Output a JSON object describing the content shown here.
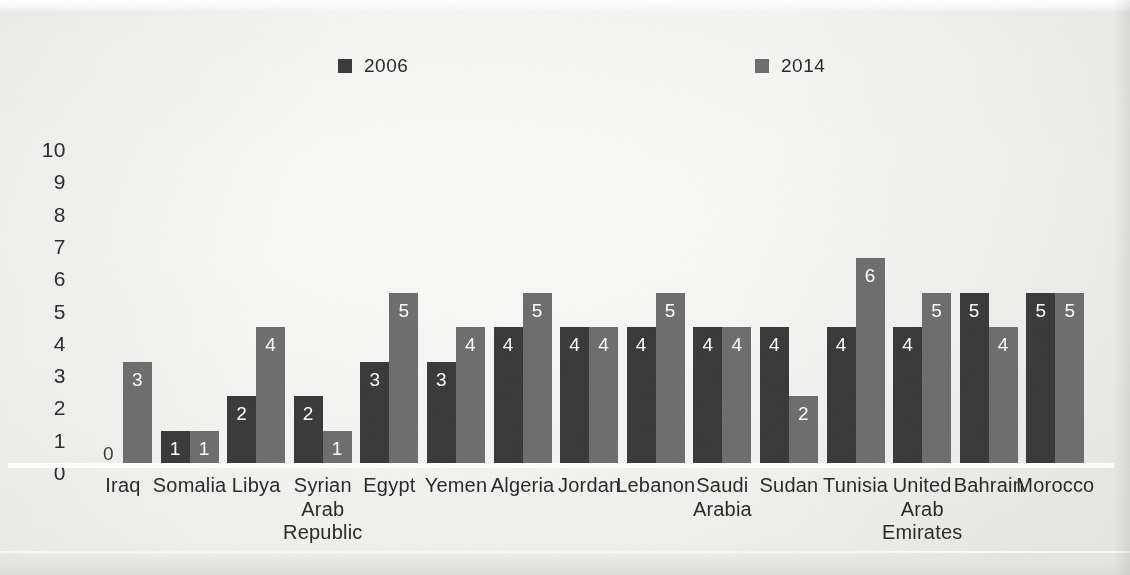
{
  "legend": {
    "entries": [
      {
        "label": "2006",
        "color": "#3b3b3b"
      },
      {
        "label": "2014",
        "color": "#6f6f6f"
      }
    ]
  },
  "y_axis": {
    "ticks": [
      "10",
      "9",
      "8",
      "7",
      "6",
      "5",
      "4",
      "3",
      "2",
      "1",
      "0"
    ]
  },
  "chart_data": {
    "type": "bar",
    "title": "",
    "subtitle": "",
    "xlabel": "",
    "ylabel": "",
    "ylim": [
      0,
      10
    ],
    "ytick_step": 1,
    "grid": false,
    "legend_position": "top",
    "orientation": "vertical",
    "grouping": "grouped",
    "bar_value_labels": true,
    "categories": [
      "Iraq",
      "Somalia",
      "Libya",
      "Syrian Arab Republic",
      "Egypt",
      "Yemen",
      "Algeria",
      "Jordan",
      "Lebanon",
      "Saudi Arabia",
      "Sudan",
      "Tunisia",
      "United Arab Emirates",
      "Bahrain",
      "Morocco"
    ],
    "category_label_lines": [
      [
        "Iraq"
      ],
      [
        "Somalia"
      ],
      [
        "Libya"
      ],
      [
        "Syrian",
        "Arab",
        "Republic"
      ],
      [
        "Egypt"
      ],
      [
        "Yemen"
      ],
      [
        "Algeria"
      ],
      [
        "Jordan"
      ],
      [
        "Lebanon"
      ],
      [
        "Saudi",
        "Arabia"
      ],
      [
        "Sudan"
      ],
      [
        "Tunisia"
      ],
      [
        "United",
        "Arab",
        "Emirates"
      ],
      [
        "Bahrain"
      ],
      [
        "Morocco"
      ]
    ],
    "series": [
      {
        "name": "2006",
        "color": "#3b3b3b",
        "values": [
          0,
          1,
          2,
          2,
          3,
          3,
          4,
          4,
          4,
          4,
          4,
          4,
          4,
          5,
          5
        ]
      },
      {
        "name": "2014",
        "color": "#6f6f6f",
        "values": [
          3,
          1,
          4,
          1,
          5,
          4,
          5,
          4,
          5,
          4,
          2,
          6,
          5,
          4,
          5
        ]
      }
    ]
  }
}
